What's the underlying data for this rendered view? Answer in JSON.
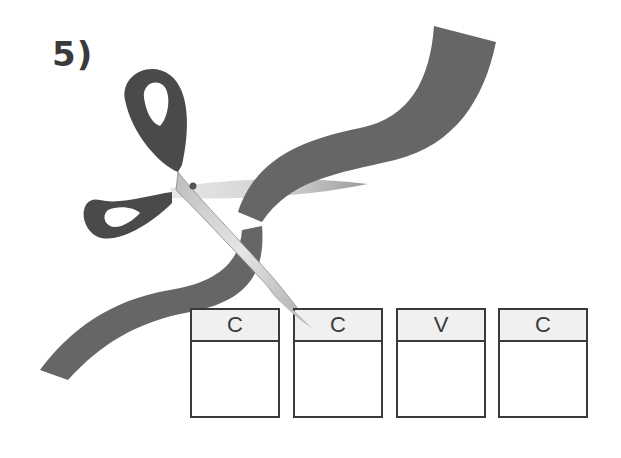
{
  "exercise": {
    "number_label": "5)"
  },
  "illustration": {
    "scissors_icon": "scissors-icon",
    "ribbon": "cut-ribbon",
    "colors": {
      "ribbon": "#666666",
      "handles": "#4a4a4a",
      "blade": "#c8c8c8",
      "box_border": "#3a3a3a",
      "box_header": "#f0f0f0"
    }
  },
  "boxes": [
    {
      "header": "C",
      "answer": ""
    },
    {
      "header": "C",
      "answer": ""
    },
    {
      "header": "V",
      "answer": ""
    },
    {
      "header": "C",
      "answer": ""
    }
  ]
}
